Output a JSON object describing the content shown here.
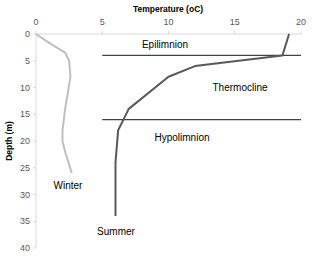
{
  "chart_data": {
    "type": "line",
    "title": "",
    "xlabel": "Temperature (oC)",
    "ylabel": "Depth (m)",
    "xlim": [
      0,
      20
    ],
    "ylim": [
      0,
      40
    ],
    "y_inverted": true,
    "x_ticks": [
      "0",
      "5",
      "10",
      "15",
      "20"
    ],
    "y_ticks": [
      "0",
      "5",
      "10",
      "15",
      "20",
      "25",
      "30",
      "35",
      "40"
    ],
    "grid": false,
    "series": [
      {
        "name": "Winter",
        "color": "#bfbfbf",
        "points": [
          [
            0,
            0
          ],
          [
            1.2,
            2
          ],
          [
            2.2,
            3.5
          ],
          [
            2.5,
            5
          ],
          [
            2.6,
            8
          ],
          [
            2.4,
            11
          ],
          [
            2.2,
            14
          ],
          [
            2.0,
            18
          ],
          [
            2.0,
            20
          ],
          [
            2.2,
            22
          ],
          [
            2.7,
            26
          ]
        ]
      },
      {
        "name": "Summer",
        "color": "#595959",
        "points": [
          [
            19.1,
            0
          ],
          [
            18.6,
            4
          ],
          [
            12,
            6
          ],
          [
            10,
            8
          ],
          [
            7,
            14
          ],
          [
            6.6,
            16
          ],
          [
            6.2,
            18
          ],
          [
            6,
            24
          ],
          [
            6,
            34
          ]
        ]
      }
    ],
    "reference_lines": [
      {
        "depth": 4,
        "x_from": 5,
        "x_to": 20
      },
      {
        "depth": 16,
        "x_from": 5,
        "x_to": 20
      }
    ],
    "annotations": [
      "Epilimnion",
      "Thermocline",
      "Hypolimnion",
      "Winter",
      "Summer"
    ]
  }
}
